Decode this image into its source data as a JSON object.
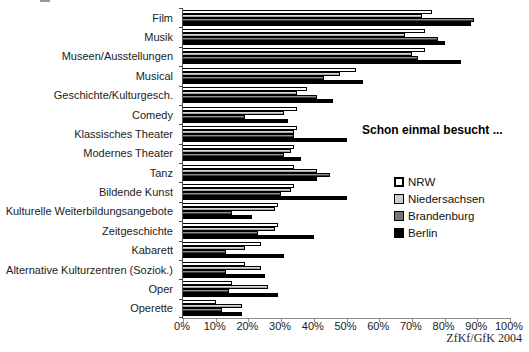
{
  "annotation": "Schon einmal besucht ...",
  "source_credit": "ZfKf/GfK 2004",
  "colors": {
    "nrw": "#ffffff",
    "niedersachsen": "#cdcdcd",
    "brandenburg": "#767676",
    "berlin": "#000000",
    "axis": "#4d4d4d"
  },
  "chart_data": {
    "type": "bar",
    "orientation": "horizontal",
    "title": "",
    "xlabel": "",
    "ylabel": "",
    "xlim": [
      0,
      100
    ],
    "grid": false,
    "legend_position": "right-middle",
    "annotation": "Schon einmal besucht ...",
    "xtick_labels": [
      "0%",
      "10%",
      "20%",
      "30%",
      "40%",
      "50%",
      "60%",
      "70%",
      "80%",
      "90%",
      "100%"
    ],
    "xtick_values": [
      0,
      10,
      20,
      30,
      40,
      50,
      60,
      70,
      80,
      90,
      100
    ],
    "categories": [
      "Film",
      "Musik",
      "Museen/Ausstellungen",
      "Musical",
      "Geschichte/Kulturgesch.",
      "Comedy",
      "Klassisches Theater",
      "Modernes Theater",
      "Tanz",
      "Bildende Kunst",
      "Kulturelle Weiterbildungsangebote",
      "Zeitgeschichte",
      "Kabarett",
      "Alternative Kulturzentren (Soziok.)",
      "Oper",
      "Operette"
    ],
    "series": [
      {
        "name": "NRW",
        "color": "#ffffff",
        "values": [
          76,
          74,
          74,
          53,
          38,
          35,
          35,
          34,
          34,
          34,
          29,
          29,
          24,
          19,
          15,
          10
        ]
      },
      {
        "name": "Niedersachsen",
        "color": "#cdcdcd",
        "values": [
          73,
          68,
          70,
          48,
          35,
          31,
          34,
          33,
          41,
          33,
          28,
          28,
          19,
          24,
          26,
          18
        ]
      },
      {
        "name": "Brandenburg",
        "color": "#767676",
        "values": [
          89,
          78,
          72,
          43,
          41,
          19,
          34,
          31,
          45,
          30,
          15,
          23,
          13,
          13,
          14,
          12
        ]
      },
      {
        "name": "Berlin",
        "color": "#000000",
        "values": [
          88,
          80,
          85,
          55,
          46,
          32,
          50,
          36,
          41,
          50,
          21,
          40,
          31,
          25,
          29,
          18
        ]
      }
    ]
  }
}
